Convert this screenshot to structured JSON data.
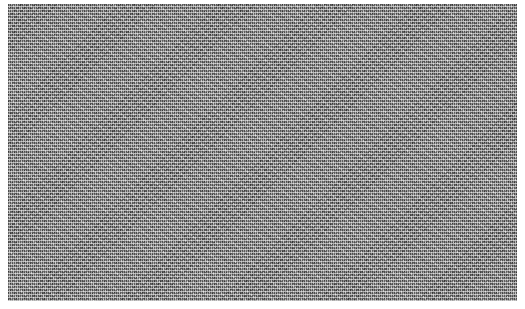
{
  "canvas": {
    "width": 525,
    "height": 309,
    "background_color": "#ffffff"
  },
  "noise_panel": {
    "description": "Random grayscale static noise; no legible text or UI elements",
    "base_color": "#8a8a8a",
    "text": ""
  }
}
